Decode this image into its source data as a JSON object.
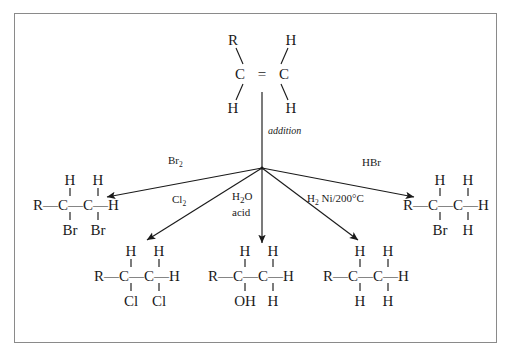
{
  "diagram": {
    "center_label": "addition",
    "frame_color": "#8a8a8a",
    "ink_color": "#1a1a1a",
    "background": "#ffffff"
  },
  "reactant": {
    "name": "alkene",
    "left_carbon": "C",
    "right_carbon": "C",
    "double_bond": "=",
    "top_left_substituent": "R",
    "top_right_substituent": "H",
    "bottom_left_substituent": "H",
    "bottom_right_substituent": "H"
  },
  "reagents": {
    "br2": "Br",
    "br2_sub": "2",
    "cl2": "Cl",
    "cl2_sub": "2",
    "water": "H",
    "water_sub": "2",
    "water_rest": "O",
    "acid": "acid",
    "h2": "H",
    "h2_sub": "2",
    "h2_rest": " Ni/200°C",
    "hbr": "HBr"
  },
  "products": {
    "bromination": {
      "label": "1,2-dibromide",
      "top": [
        "H",
        "H"
      ],
      "backbone": [
        "R",
        "—",
        "C",
        "—",
        "C",
        "—",
        "H"
      ],
      "bottom": [
        "Br",
        "Br"
      ]
    },
    "chlorination": {
      "label": "1,2-dichloride",
      "top": [
        "H",
        "H"
      ],
      "backbone": [
        "R",
        "—",
        "C",
        "—",
        "C",
        "—",
        "H"
      ],
      "bottom": [
        "Cl",
        "Cl"
      ]
    },
    "hydration": {
      "label": "alcohol",
      "top": [
        "H",
        "H"
      ],
      "backbone": [
        "R",
        "—",
        "C",
        "—",
        "C",
        "—",
        "H"
      ],
      "bottom": [
        "OH",
        "H"
      ]
    },
    "hydrogenation": {
      "label": "alkane",
      "top": [
        "H",
        "H"
      ],
      "backbone": [
        "R",
        "—",
        "C",
        "—",
        "C",
        "—",
        "H"
      ],
      "bottom": [
        "H",
        "H"
      ]
    },
    "hydrobromination": {
      "label": "alkyl bromide",
      "top": [
        "H",
        "H"
      ],
      "backbone": [
        "R",
        "—",
        "C",
        "—",
        "C",
        "—",
        "H"
      ],
      "bottom": [
        "Br",
        "H"
      ]
    }
  }
}
